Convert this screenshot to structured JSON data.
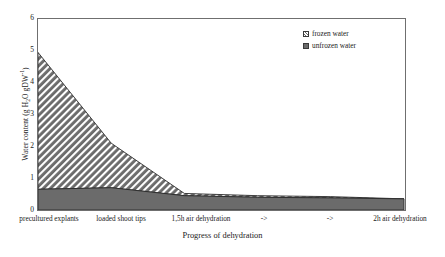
{
  "chart_data": {
    "type": "area",
    "title": "",
    "subtitle": "",
    "xlabel": "Progress of dehydration",
    "ylabel": "Water content (g H2O gDW-1)",
    "ylabel_parts": {
      "prefix": "Water content (g H",
      "sub": "2",
      "mid": "O gDW",
      "sup": "-1",
      "suffix": ")"
    },
    "categories": [
      "precultured explants",
      "loaded shoot tips",
      "1,5h air dehydration",
      "->",
      "->",
      "2h air dehydration"
    ],
    "series": [
      {
        "name": "unfrozen water",
        "values": [
          0.65,
          0.7,
          0.45,
          0.4,
          0.38,
          0.35
        ],
        "color": "#6b6b6b",
        "fill": "solid"
      },
      {
        "name": "frozen water",
        "values": [
          4.3,
          1.4,
          0.07,
          0.05,
          0.04,
          0.0
        ],
        "color": "#6b6b6b",
        "fill": "hatched"
      }
    ],
    "stacked_totals": [
      4.95,
      2.1,
      0.52,
      0.45,
      0.42,
      0.35
    ],
    "yticks": [
      6,
      5,
      4,
      3,
      2,
      1,
      0
    ],
    "ylim": [
      0,
      6
    ],
    "xlim": [
      0,
      5
    ],
    "grid": false,
    "legend_position": "top-right",
    "legend": [
      {
        "label": "frozen water",
        "fill": "hatched"
      },
      {
        "label": "unfrozen water",
        "fill": "solid"
      }
    ]
  },
  "axes": {
    "y_tick_labels": [
      "6",
      "5",
      "4",
      "3",
      "2",
      "1",
      "0"
    ],
    "x_tick_labels": [
      "precultured explants",
      "loaded shoot tips",
      "1,5h air dehydration",
      "->",
      "->",
      "2h air dehydration"
    ],
    "x_axis_title": "Progress of dehydration"
  },
  "legend": {
    "frozen_label": "frozen water",
    "unfrozen_label": "unfrozen water"
  },
  "colors": {
    "series_gray": "#6b6b6b",
    "axis": "#6f6f6f",
    "text": "#222222",
    "background": "#ffffff"
  }
}
